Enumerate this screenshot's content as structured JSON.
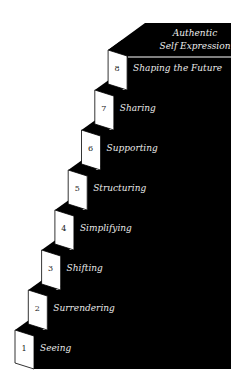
{
  "diagram": {
    "type": "staircase",
    "top_label_line1": "Authentic",
    "top_label_line2": "Self Expression",
    "steps": [
      {
        "number": "1",
        "label": "Seeing"
      },
      {
        "number": "2",
        "label": "Surrendering"
      },
      {
        "number": "3",
        "label": "Shifting"
      },
      {
        "number": "4",
        "label": "Simplifying"
      },
      {
        "number": "5",
        "label": "Structuring"
      },
      {
        "number": "6",
        "label": "Supporting"
      },
      {
        "number": "7",
        "label": "Sharing"
      },
      {
        "number": "8",
        "label": "Shaping the Future"
      }
    ],
    "colors": {
      "block": "#000000",
      "face": "#ffffff",
      "text": "#e8e8e8"
    }
  }
}
